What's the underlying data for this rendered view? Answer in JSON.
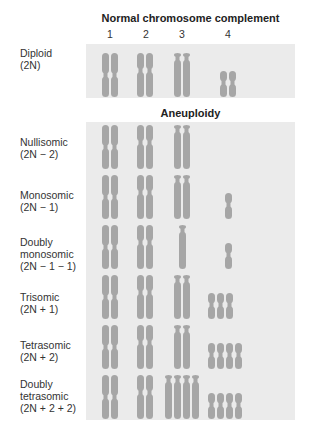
{
  "normal": {
    "title": "Normal chromosome complement",
    "column_labels": [
      "1",
      "2",
      "3",
      "4"
    ],
    "row": {
      "label": "Diploid\n(2N)",
      "counts": [
        2,
        2,
        2,
        2
      ]
    }
  },
  "aneuploidy": {
    "title": "Aneuploidy",
    "rows": [
      {
        "label": "Nullisomic\n(2N − 2)",
        "counts": [
          2,
          2,
          2,
          0
        ]
      },
      {
        "label": "Monosomic\n(2N − 1)",
        "counts": [
          2,
          2,
          2,
          1
        ]
      },
      {
        "label": "Doubly\nmonosomic\n(2N − 1 − 1)",
        "counts": [
          2,
          2,
          1,
          1
        ]
      },
      {
        "label": "Trisomic\n(2N + 1)",
        "counts": [
          2,
          2,
          2,
          3
        ]
      },
      {
        "label": "Tetrasomic\n(2N + 2)",
        "counts": [
          2,
          2,
          2,
          4
        ]
      },
      {
        "label": "Doubly\ntetrasomic\n(2N + 2 + 2)",
        "counts": [
          2,
          2,
          4,
          4
        ]
      }
    ]
  },
  "colors": {
    "panel_bg": "#ebebeb",
    "chromosome": "#a6a6a6"
  }
}
